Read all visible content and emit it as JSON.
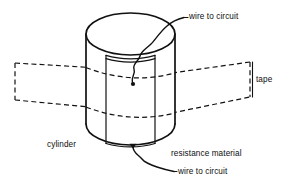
{
  "figure": {
    "ink_color": "#111111",
    "background_color": "#ffffff"
  },
  "labels": {
    "wire_top": "wire to circuit",
    "tape": "tape",
    "cylinder": "cylinder",
    "resistance_material": "resistance material",
    "wire_bottom": "wire to circuit"
  },
  "parts": [
    {
      "name": "cylinder",
      "kind": "solid-cylinder",
      "style": "solid-outline"
    },
    {
      "name": "resistance-material",
      "kind": "vertical-strip",
      "style": "solid-outline"
    },
    {
      "name": "tape",
      "kind": "band-parallelogram",
      "style": "dashed-outline"
    },
    {
      "name": "wire-top",
      "kind": "wavy-wire",
      "style": "solid-line"
    },
    {
      "name": "wire-bottom",
      "kind": "wavy-wire",
      "style": "solid-line"
    }
  ],
  "geometry": {
    "cylinder": {
      "left_x": 86,
      "right_x": 175,
      "top_ellipse_center_y": 34,
      "top_ellipse_ry": 21,
      "bottom_ellipse_center_y": 124,
      "bottom_ellipse_ry": 21
    },
    "resistance_strip": {
      "left_x": 106,
      "right_x": 155
    },
    "tape": {
      "left_edge_x": 15,
      "right_edge_x": 250,
      "left_top_y": 63,
      "left_bottom_y": 100,
      "right_top_y": 62,
      "right_bottom_y": 97
    }
  }
}
